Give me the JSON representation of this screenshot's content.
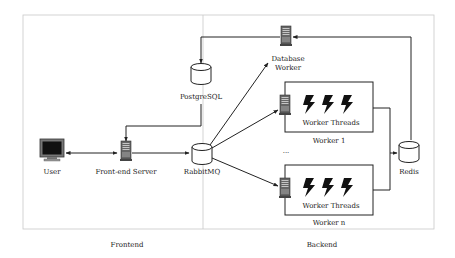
{
  "diagram": {
    "type": "architecture",
    "regions": [
      {
        "id": "frontend",
        "label": "Frontend"
      },
      {
        "id": "backend",
        "label": "Backend"
      }
    ],
    "nodes": {
      "user": {
        "label": "User",
        "icon": "monitor-icon"
      },
      "frontend_server": {
        "label": "Front-end Server",
        "icon": "server-icon"
      },
      "rabbitmq": {
        "label": "RabbitMQ",
        "icon": "database-cylinder-icon"
      },
      "postgresql": {
        "label": "PostgreSQL",
        "icon": "database-cylinder-icon"
      },
      "database_worker": {
        "label_line1": "Database",
        "label_line2": "Worker",
        "icon": "server-icon"
      },
      "worker1": {
        "label": "Worker 1",
        "threads_label": "Worker Threads",
        "icon": "server-icon"
      },
      "workern": {
        "label": "Worker n",
        "threads_label": "Worker Threads",
        "icon": "server-icon"
      },
      "ellipsis": "...",
      "redis": {
        "label": "Redis",
        "icon": "database-cylinder-icon"
      }
    },
    "edges": [
      {
        "from": "User",
        "to": "Front-end Server",
        "bidirectional": true
      },
      {
        "from": "Front-end Server",
        "to": "RabbitMQ"
      },
      {
        "from": "PostgreSQL",
        "to": "Front-end Server"
      },
      {
        "from": "RabbitMQ",
        "to": "Database Worker"
      },
      {
        "from": "RabbitMQ",
        "to": "Worker 1"
      },
      {
        "from": "RabbitMQ",
        "to": "Worker n"
      },
      {
        "from": "Database Worker",
        "to": "PostgreSQL"
      },
      {
        "from": "Worker 1",
        "to": "Redis"
      },
      {
        "from": "Worker n",
        "to": "Redis"
      },
      {
        "from": "Redis",
        "to": "Database Worker"
      }
    ],
    "colors": {
      "line": "#222222",
      "frame": "#c8c8c8",
      "screen": "#111111",
      "monitor": "#777777"
    }
  }
}
